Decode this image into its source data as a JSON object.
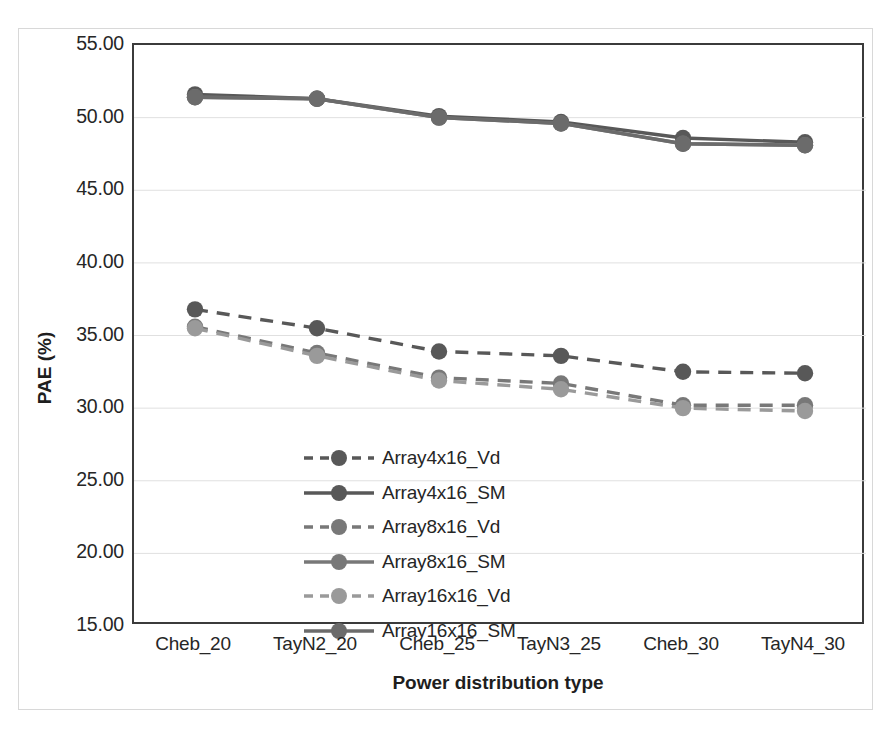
{
  "chart_data": {
    "type": "line",
    "title": "",
    "xlabel": "Power distribution type",
    "ylabel": "PAE (%)",
    "categories": [
      "Cheb_20",
      "TayN2_20",
      "Cheb_25",
      "TayN3_25",
      "Cheb_30",
      "TayN4_30"
    ],
    "ylim": [
      15.0,
      55.0
    ],
    "ytick_step": 5.0,
    "yticks": [
      "55.00",
      "50.00",
      "45.00",
      "40.00",
      "35.00",
      "30.00",
      "25.00",
      "20.00",
      "15.00"
    ],
    "ytick_values": [
      55.0,
      50.0,
      45.0,
      40.0,
      35.0,
      30.0,
      25.0,
      20.0,
      15.0
    ],
    "grid": "horizontal",
    "legend_position": "inside-lower-left",
    "series": [
      {
        "name": "Array4x16_Vd",
        "values": [
          36.8,
          35.5,
          33.9,
          33.6,
          32.5,
          32.4
        ],
        "style": "dashed",
        "color": "#585858",
        "marker": "circle"
      },
      {
        "name": "Array4x16_SM",
        "values": [
          51.6,
          51.3,
          50.1,
          49.7,
          48.6,
          48.3
        ],
        "style": "solid",
        "color": "#585858",
        "marker": "circle"
      },
      {
        "name": "Array8x16_Vd",
        "values": [
          35.6,
          33.8,
          32.1,
          31.7,
          30.2,
          30.2
        ],
        "style": "dashed",
        "color": "#787878",
        "marker": "circle"
      },
      {
        "name": "Array8x16_SM",
        "values": [
          51.4,
          51.3,
          50.0,
          49.6,
          48.2,
          48.1
        ],
        "style": "solid",
        "color": "#787878",
        "marker": "circle"
      },
      {
        "name": "Array16x16_Vd",
        "values": [
          35.5,
          33.6,
          31.9,
          31.3,
          30.0,
          29.8
        ],
        "style": "dashed",
        "color": "#9a9a9a",
        "marker": "circle"
      },
      {
        "name": "Array16x16_SM",
        "values": [
          51.4,
          51.3,
          50.0,
          49.6,
          48.2,
          48.1
        ],
        "style": "solid",
        "color": "#6b6b6b",
        "marker": "circle"
      }
    ]
  },
  "colors": {
    "axis": "#3b3b3b",
    "grid": "#e0e0e0",
    "text": "#262626",
    "dark_gray": "#585858",
    "medium_gray": "#787878",
    "light_gray": "#9a9a9a"
  }
}
